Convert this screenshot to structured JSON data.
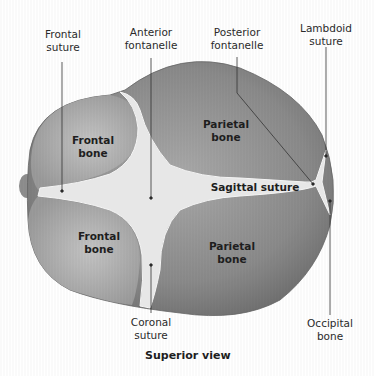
{
  "figure": {
    "caption": "Superior view",
    "callouts": [
      {
        "id": "frontal-suture",
        "text": "Frontal\nsuture"
      },
      {
        "id": "anterior-fontanelle",
        "text": "Anterior\nfontanelle"
      },
      {
        "id": "posterior-fontanelle",
        "text": "Posterior\nfontanelle"
      },
      {
        "id": "lambdoid-suture",
        "text": "Lambdoid\nsuture"
      },
      {
        "id": "coronal-suture",
        "text": "Coronal\nsuture"
      },
      {
        "id": "occipital-bone",
        "text": "Occipital\nbone"
      }
    ],
    "regions": [
      {
        "id": "frontal-bone-upper",
        "text": "Frontal\nbone"
      },
      {
        "id": "frontal-bone-lower",
        "text": "Frontal\nbone"
      },
      {
        "id": "parietal-bone-upper",
        "text": "Parietal\nbone"
      },
      {
        "id": "parietal-bone-lower",
        "text": "Parietal\nbone"
      },
      {
        "id": "sagittal-suture",
        "text": "Sagittal suture"
      }
    ],
    "colors": {
      "bone_dark": "#7d7d7d",
      "bone_light": "#b5b5b5",
      "suture": "#e6e6e6",
      "leader": "#333333"
    }
  }
}
